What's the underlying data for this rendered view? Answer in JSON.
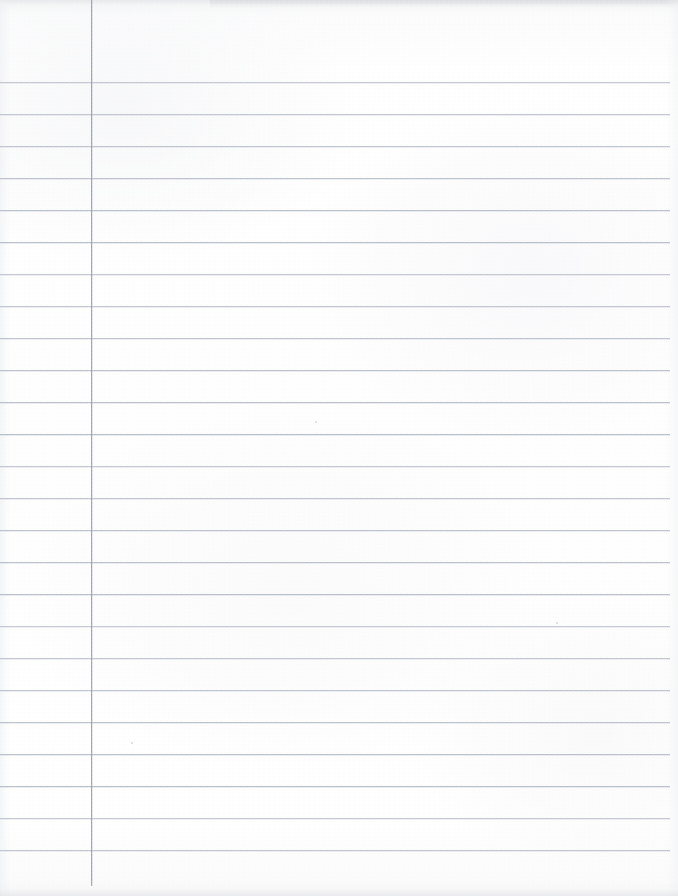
{
  "document": {
    "kind": "scanned-ruled-notebook-paper",
    "page_label": "",
    "content_text": "",
    "width_px": 678,
    "height_px": 896
  },
  "paper": {
    "background_color": "#fcfcfc",
    "edge_shadow_color": "#cdd0d4",
    "grain_visible": true
  },
  "rules": {
    "horizontal": {
      "color": "#b6bcc4",
      "thickness_px": 1,
      "spacing_px": 32,
      "first_y_px": 82,
      "left_x_px": 0,
      "right_x_px": 670,
      "count": 25,
      "y_positions": [
        82,
        114,
        146,
        178,
        210,
        242,
        274,
        306,
        338,
        370,
        402,
        434,
        466,
        498,
        530,
        562,
        594,
        626,
        658,
        690,
        722,
        754,
        786,
        818,
        850
      ]
    },
    "vertical_margin": {
      "color": "#9aa0a8",
      "thickness_px": 1,
      "x_px": 91,
      "top_y_px": 0,
      "bottom_y_px": 886
    }
  },
  "marks": {
    "specks": [
      {
        "x": 315,
        "y": 421,
        "size": 2
      },
      {
        "x": 556,
        "y": 622,
        "size": 2
      },
      {
        "x": 131,
        "y": 742,
        "size": 2
      }
    ]
  }
}
